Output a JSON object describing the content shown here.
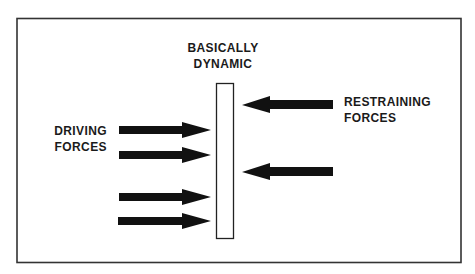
{
  "diagram": {
    "title_lines": [
      "BASICALLY",
      "DYNAMIC"
    ],
    "driving_label_lines": [
      "DRIVING",
      "FORCES"
    ],
    "restraining_label_lines": [
      "RESTRAINING",
      "FORCES"
    ],
    "driving_force_count": 4,
    "restraining_force_count": 2,
    "colors": {
      "frame": "#333333",
      "arrow": "#111111",
      "bar_fill": "#ffffff",
      "text": "#1a1a1a"
    }
  }
}
